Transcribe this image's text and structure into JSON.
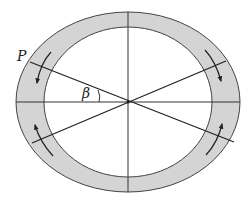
{
  "diagram": {
    "type": "rotating-elliptical-ring",
    "labels": {
      "point": "P",
      "angle": "β"
    },
    "colors": {
      "ring_fill": "#d4d4d4",
      "stroke": "#333333",
      "background": "#ffffff"
    },
    "geometry": {
      "center": [
        128,
        102
      ],
      "outer_ellipse": {
        "rx": 112,
        "ry": 90
      },
      "inner_ellipse": {
        "rx": 84,
        "ry": 75
      },
      "lines": [
        {
          "name": "vertical-axis",
          "from": [
            128,
            13
          ],
          "to": [
            128,
            192
          ]
        },
        {
          "name": "horizontal-axis",
          "from": [
            16,
            102
          ],
          "to": [
            240,
            102
          ]
        },
        {
          "name": "diagonal-through-P",
          "from": [
            30,
            62
          ],
          "to": [
            234,
            142
          ]
        },
        {
          "name": "diagonal-2",
          "from": [
            32,
            143
          ],
          "to": [
            226,
            61
          ]
        }
      ]
    },
    "arrows": [
      {
        "name": "upper-left",
        "direction": "down"
      },
      {
        "name": "upper-right",
        "direction": "down"
      },
      {
        "name": "lower-left",
        "direction": "up"
      },
      {
        "name": "lower-right",
        "direction": "up"
      }
    ]
  }
}
